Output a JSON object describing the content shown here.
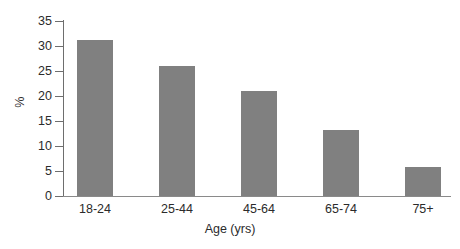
{
  "chart_data": {
    "type": "bar",
    "title": "",
    "subtitle": "",
    "xlabel": "Age (yrs)",
    "ylabel": "%",
    "categories": [
      "18-24",
      "25-44",
      "45-64",
      "65-74",
      "75+"
    ],
    "values": [
      31.3,
      26.0,
      21.0,
      13.3,
      5.9
    ],
    "series": [
      {
        "name": "",
        "values": [
          31.3,
          26.0,
          21.0,
          13.3,
          5.9
        ]
      }
    ],
    "ylim": [
      0,
      35
    ],
    "yticks": [
      0,
      5,
      10,
      15,
      20,
      25,
      30,
      35
    ],
    "ytick_labels": [
      "0",
      "5",
      "10",
      "15",
      "20",
      "25",
      "30",
      "35"
    ],
    "grid": false,
    "legend": false,
    "legend_position": "none",
    "bar_color": "#808080",
    "axis_color": "#6e6e6e",
    "background_color": "#ffffff",
    "annotations": []
  }
}
